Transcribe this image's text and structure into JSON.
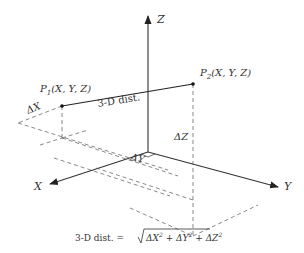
{
  "diagram": {
    "axes": {
      "x_label": "X",
      "y_label": "Y",
      "z_label": "Z"
    },
    "points": {
      "p1": {
        "name": "P",
        "subscript": "1",
        "coords": "(X, Y, Z)"
      },
      "p2": {
        "name": "P",
        "subscript": "2",
        "coords": "(X, Y, Z)"
      }
    },
    "segment_label": "3-D dist.",
    "deltas": {
      "dx": "ΔX",
      "dy": "ΔY",
      "dz": "ΔZ"
    },
    "formula": {
      "lhs": "3-D dist. =",
      "terms": [
        "ΔX",
        "ΔY",
        "ΔZ"
      ],
      "exponent": "2",
      "operator": "+"
    },
    "colors": {
      "line": "#222222",
      "dashed": "#555555",
      "text": "#333333"
    }
  }
}
